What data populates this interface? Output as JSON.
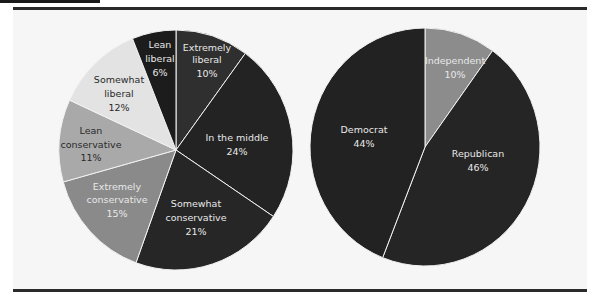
{
  "chart_data": [
    {
      "type": "pie",
      "title": "",
      "categories": [
        "Extremely liberal",
        "In the middle",
        "Somewhat conservative",
        "Extremely conservative",
        "Lean conservative",
        "Somewhat liberal",
        "Lean liberal"
      ],
      "values": [
        10,
        24,
        21,
        15,
        11,
        12,
        6
      ],
      "value_labels": [
        "10%",
        "24%",
        "21%",
        "15%",
        "11%",
        "12%",
        "6%"
      ],
      "colors": [
        "#2f2f2f",
        "#232323",
        "#262626",
        "#8a8a8a",
        "#a9a9a9",
        "#e3e3e3",
        "#1c1c1c"
      ],
      "start_angle": "12 o'clock, clockwise",
      "legend": "none (inline labels)"
    },
    {
      "type": "pie",
      "title": "",
      "categories": [
        "Independent",
        "Republican",
        "Democrat"
      ],
      "values": [
        10,
        46,
        44
      ],
      "value_labels": [
        "10%",
        "46%",
        "44%"
      ],
      "colors": [
        "#8c8c8c",
        "#252525",
        "#222222"
      ],
      "start_angle": "12 o'clock, clockwise",
      "legend": "none (inline labels)"
    }
  ],
  "left_pie": {
    "slices": [
      {
        "name": "Extremely liberal",
        "line1": "Extremely",
        "line2": "liberal",
        "pct": "10%"
      },
      {
        "name": "In the middle",
        "line1": "In the middle",
        "line2": "",
        "pct": "24%"
      },
      {
        "name": "Somewhat conservative",
        "line1": "Somewhat",
        "line2": "conservative",
        "pct": "21%"
      },
      {
        "name": "Extremely conservative",
        "line1": "Extremely",
        "line2": "conservative",
        "pct": "15%"
      },
      {
        "name": "Lean conservative",
        "line1": "Lean",
        "line2": "conservative",
        "pct": "11%"
      },
      {
        "name": "Somewhat liberal",
        "line1": "Somewhat",
        "line2": "liberal",
        "pct": "12%"
      },
      {
        "name": "Lean liberal",
        "line1": "Lean",
        "line2": "liberal",
        "pct": "6%"
      }
    ]
  },
  "right_pie": {
    "slices": [
      {
        "name": "Independent",
        "line1": "Independent",
        "pct": "10%"
      },
      {
        "name": "Republican",
        "line1": "Republican",
        "pct": "46%"
      },
      {
        "name": "Democrat",
        "line1": "Democrat",
        "pct": "44%"
      }
    ]
  }
}
